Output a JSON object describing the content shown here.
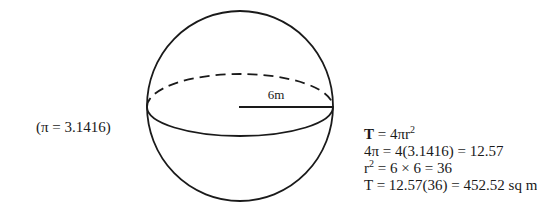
{
  "note": {
    "pi_value": "(π = 3.1416)"
  },
  "figure": {
    "shape": "sphere",
    "radius_label": "6m",
    "stroke_color": "#1a1a1a"
  },
  "calculation": {
    "line1": {
      "lhs": "T",
      "rhs_prefix": " = 4πr",
      "exp": "2"
    },
    "line2": {
      "text": "4π = 4(3.1416) = 12.57"
    },
    "line3": {
      "base": "r",
      "exp": "2",
      "rest": " = 6 × 6 = 36"
    },
    "line4": {
      "text": "T = 12.57(36) = 452.52 sq m"
    }
  }
}
